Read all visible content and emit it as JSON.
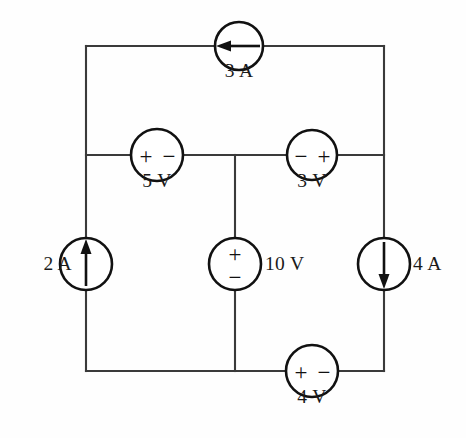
{
  "figure": {
    "background_color": "#fefefe",
    "wire_color": "#3a3a3a",
    "symbol_color": "#111111"
  },
  "sources": {
    "top_current": {
      "label": "3 A",
      "type": "current-source",
      "arrow_direction": "left",
      "branch": "top",
      "cx": 239,
      "cy": 46,
      "r": 24,
      "label_x": 239,
      "label_y": 72
    },
    "left_current": {
      "label": "2 A",
      "type": "current-source",
      "arrow_direction": "up",
      "branch": "left",
      "cx": 86,
      "cy": 264,
      "r": 26,
      "label_x": 54,
      "label_y": 264
    },
    "right_current": {
      "label": "4 A",
      "type": "current-source",
      "arrow_direction": "down",
      "branch": "right",
      "cx": 384,
      "cy": 264,
      "r": 26,
      "label_x": 416,
      "label_y": 264
    },
    "middle_left_voltage": {
      "label": "5 V",
      "type": "voltage-source",
      "polarity": "+ −",
      "left_sign": "+",
      "right_sign": "−",
      "orientation": "horizontal",
      "branch": "middle-left",
      "cx": 157,
      "cy": 155,
      "r": 26,
      "label_x": 157,
      "label_y": 181
    },
    "middle_right_voltage": {
      "label": "3 V",
      "type": "voltage-source",
      "polarity": "− +",
      "left_sign": "−",
      "right_sign": "+",
      "orientation": "horizontal",
      "branch": "middle-right",
      "cx": 312,
      "cy": 155,
      "r": 25,
      "label_x": 312,
      "label_y": 181
    },
    "center_voltage": {
      "label": "10 V",
      "type": "voltage-source",
      "polarity": "+ over −",
      "top_sign": "+",
      "bottom_sign": "−",
      "orientation": "vertical",
      "branch": "center",
      "cx": 235,
      "cy": 264,
      "r": 26,
      "label_x": 266,
      "label_y": 264
    },
    "bottom_voltage": {
      "label": "4 V",
      "type": "voltage-source",
      "polarity": "+ −",
      "left_sign": "+",
      "right_sign": "−",
      "orientation": "horizontal",
      "branch": "bottom",
      "cx": 312,
      "cy": 371,
      "r": 26,
      "label_x": 312,
      "label_y": 397
    }
  },
  "geometry": {
    "left_x": 86,
    "right_x": 384,
    "top_y": 46,
    "middle_y": 155,
    "bottom_y": 371,
    "center_x": 235
  }
}
